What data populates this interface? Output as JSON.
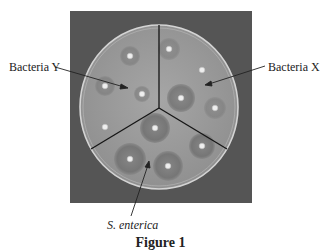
{
  "figure": {
    "caption": "Figure 1",
    "image": {
      "description": "Agar plate divided into three sectors with antibiotic discs and inhibition zones",
      "sectors": [
        {
          "name": "Bacteria Y",
          "discs": 4
        },
        {
          "name": "Bacteria X",
          "discs": 4
        },
        {
          "name": "S. enterica",
          "discs": 4
        }
      ]
    },
    "labels": {
      "bacteria_y": "Bacteria Y",
      "bacteria_x": "Bacteria X",
      "s_enterica": "S. enterica"
    }
  },
  "colors": {
    "background_photo": "#555555",
    "plate": "#9c9c9c",
    "plate_rim": "#d8d8d8",
    "zone": "#7e7e7e",
    "disc": "#eeeeee",
    "divider": "#151515",
    "text": "#222222"
  }
}
